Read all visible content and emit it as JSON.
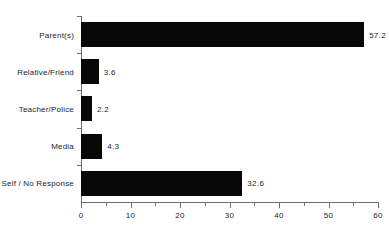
{
  "chart_data": {
    "type": "bar",
    "orientation": "horizontal",
    "title": "",
    "xlabel": "",
    "ylabel": "",
    "categories": [
      "Parent(s)",
      "Relative/Friend",
      "Teacher/Police",
      "Media",
      "Self / No Response"
    ],
    "values": [
      57.2,
      3.6,
      2.2,
      4.3,
      32.6
    ],
    "value_labels": [
      "57.2",
      "3.6",
      "2.2",
      "4.3",
      "32.6"
    ],
    "xlim": [
      0,
      60
    ],
    "xticks": [
      0,
      10,
      20,
      30,
      40,
      50,
      60
    ],
    "xtick_labels": [
      "0",
      "10",
      "20",
      "30",
      "40",
      "50",
      "60"
    ],
    "minor_xticks": [
      5,
      15,
      25,
      35,
      45,
      55
    ],
    "grid": false,
    "legend": null,
    "bar_color": "#080808",
    "axis_color": "#6e6e70",
    "text_color": "#1d1d1f",
    "background": "#ffffff"
  }
}
